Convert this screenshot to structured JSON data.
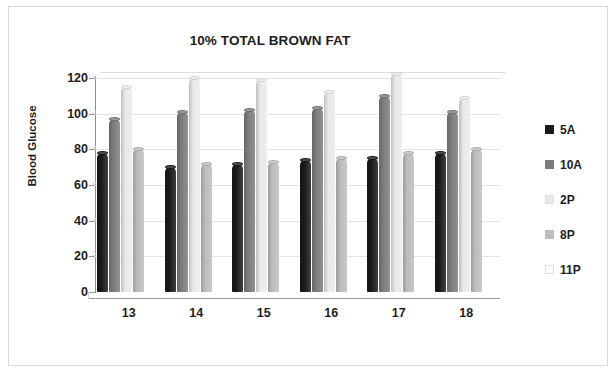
{
  "chart_data": {
    "type": "bar",
    "title": "10% TOTAL BROWN FAT",
    "xlabel": "Participants",
    "ylabel": "Blood Glucose",
    "categories": [
      "13",
      "14",
      "15",
      "16",
      "17",
      "18"
    ],
    "ylim": [
      0,
      120
    ],
    "yticks": [
      "0",
      "20",
      "40",
      "60",
      "80",
      "100",
      "120"
    ],
    "ytick_values": [
      0,
      20,
      40,
      60,
      80,
      100,
      120
    ],
    "grid": true,
    "legend_position": "right",
    "series": [
      {
        "name": "5A",
        "color": "#1a1a1a",
        "values": [
          78,
          70,
          72,
          74,
          75,
          78
        ]
      },
      {
        "name": "10A",
        "color": "#7c7c7c",
        "values": [
          97,
          101,
          102,
          103,
          110,
          101
        ]
      },
      {
        "name": "2P",
        "color": "#e9e9e9",
        "values": [
          115,
          120,
          119,
          112,
          122,
          109
        ]
      },
      {
        "name": "8P",
        "color": "#bdbdbd",
        "values": [
          80,
          72,
          73,
          75,
          78,
          80
        ]
      },
      {
        "name": "11P",
        "color": "#fdfdfd",
        "values": [
          0,
          0,
          0,
          0,
          0,
          0
        ]
      }
    ]
  }
}
